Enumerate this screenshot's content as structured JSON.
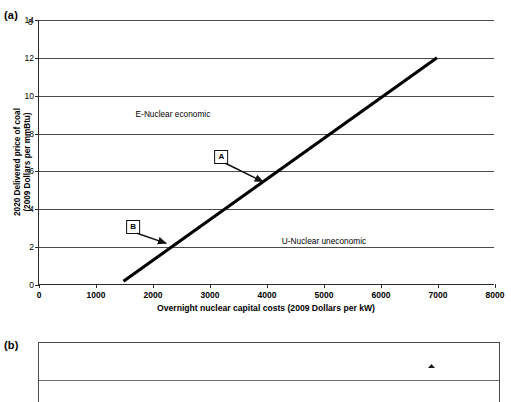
{
  "panels": {
    "a": {
      "tag": "(a)"
    },
    "b": {
      "tag": "(b)",
      "ytop_label": "8"
    }
  },
  "chart_data": {
    "type": "line",
    "title": "",
    "xlabel": "Overnight nuclear capital costs (2009 Dollars per kW)",
    "ylabel": "2020 Delivered price of coal\n(2009 Dollars per mmBtu)",
    "ylabel_line1": "2020 Delivered price of coal",
    "ylabel_line2": "(2009 Dollars per mmBtu)",
    "xlim": [
      0,
      8000
    ],
    "ylim": [
      0,
      14
    ],
    "xticks": [
      0,
      1000,
      2000,
      3000,
      4000,
      5000,
      6000,
      7000,
      8000
    ],
    "xtick_labels": [
      "0",
      "1000",
      "2000",
      "3000",
      "4000",
      "5000",
      "6000",
      "7000",
      "8000"
    ],
    "yticks": [
      0,
      2,
      4,
      6,
      8,
      10,
      12,
      14
    ],
    "ytick_labels": [
      "0",
      "2",
      "4",
      "6",
      "8",
      "10",
      "12",
      "14"
    ],
    "grid": "horizontal",
    "legend": "none",
    "series": [
      {
        "name": "nuclear-coal breakeven",
        "style": "solid-thick-black",
        "color": "#000000",
        "x": [
          1500,
          7000
        ],
        "values": [
          0.2,
          12.0
        ]
      }
    ],
    "annotations": [
      {
        "id": "region-upper",
        "text": "E-Nuclear economic",
        "x": 2350,
        "y": 9.05,
        "kind": "region-label"
      },
      {
        "id": "region-lower",
        "text": "U-Nuclear uneconomic",
        "x": 5000,
        "y": 2.35,
        "kind": "region-label"
      },
      {
        "id": "callout-a",
        "text": "A",
        "box_x": 3200,
        "box_y": 6.75,
        "tip_x": 3950,
        "tip_y": 5.45,
        "kind": "boxed-callout"
      },
      {
        "id": "callout-b",
        "text": "B",
        "box_x": 1650,
        "box_y": 3.05,
        "tip_x": 2250,
        "tip_y": 2.2,
        "kind": "boxed-callout"
      }
    ]
  },
  "chart_data_b": {
    "type": "line",
    "title": "",
    "note": "panel cropped at image bottom edge",
    "ylim": [
      0,
      8
    ],
    "ytick_labels_visible": [
      "8"
    ],
    "grid": "horizontal"
  }
}
